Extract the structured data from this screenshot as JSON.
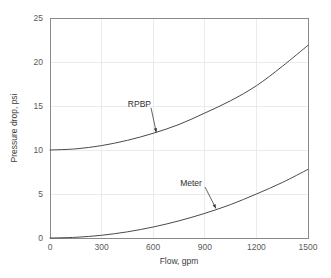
{
  "chart_data": {
    "type": "line",
    "title": "",
    "xlabel": "Flow, gpm",
    "ylabel": "Pressure drop, psi",
    "xlim": [
      0,
      1500
    ],
    "ylim": [
      0,
      25
    ],
    "xticks": [
      0,
      300,
      600,
      900,
      1200,
      1500
    ],
    "yticks": [
      0,
      5,
      10,
      15,
      20,
      25
    ],
    "xtick_labels": [
      "0",
      "300",
      "600",
      "900",
      "1200",
      "1500"
    ],
    "ytick_labels": [
      "0",
      "5",
      "10",
      "15",
      "20",
      "25"
    ],
    "grid": true,
    "grid_axis": "both",
    "legend": "none",
    "x": [
      0,
      150,
      300,
      450,
      600,
      750,
      900,
      1050,
      1200,
      1350,
      1500
    ],
    "series": [
      {
        "name": "RPBP",
        "values": [
          10.0,
          10.13,
          10.5,
          11.1,
          11.9,
          12.9,
          14.2,
          15.6,
          17.3,
          19.5,
          21.9
        ],
        "color": "#4a4a4a"
      },
      {
        "name": "Meter",
        "values": [
          0.0,
          0.08,
          0.31,
          0.7,
          1.25,
          1.95,
          2.8,
          3.8,
          5.0,
          6.3,
          7.8
        ],
        "color": "#4a4a4a"
      }
    ],
    "annotations": [
      {
        "text": "RPBP",
        "label_x": 520,
        "label_y": 14.9,
        "target_x": 618,
        "target_y": 12.0
      },
      {
        "text": "Meter",
        "label_x": 820,
        "label_y": 5.9,
        "target_x": 965,
        "target_y": 3.35
      }
    ]
  },
  "colors": {
    "background": "#ffffff",
    "grid": "#e6e6e6",
    "axis_border": "#8a8a8a",
    "curve": "#4a4a4a",
    "tick_text": "#5a5a5a",
    "title_text": "#3c3c3c",
    "annotation_text": "#2e2e2e",
    "leader": "#3c3c3c"
  },
  "figure": {
    "width": 331,
    "height": 278,
    "plot_left": 50,
    "plot_right": 308,
    "plot_top": 18,
    "plot_bottom": 238
  }
}
